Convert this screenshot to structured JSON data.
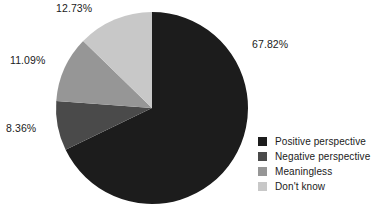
{
  "chart_data": {
    "type": "pie",
    "title": "",
    "labels": [
      "Positive perspective",
      "Negative perspective",
      "Meaningless",
      "Don't know"
    ],
    "values": [
      67.82,
      11.09,
      8.36,
      12.73
    ],
    "value_labels": [
      "67.82%",
      "11.09%",
      "8.36%",
      "12.73%"
    ],
    "units": "percent",
    "colors": [
      "#1c1c1c",
      "#4a4a4a",
      "#969696",
      "#c8c8c8"
    ],
    "legend_position": "right-bottom",
    "grid": false,
    "start_angle_deg": 0,
    "direction": "clockwise",
    "slice_order_clockwise": [
      "Positive perspective",
      "Negative perspective",
      "Meaningless",
      "Don't know"
    ],
    "slice_values_clockwise": [
      67.82,
      8.36,
      11.09,
      12.73
    ]
  },
  "labels": {
    "positive": "67.82%",
    "negative": "8.36%",
    "meaningless": "11.09%",
    "dontknow": "12.73%"
  },
  "legend": {
    "items": [
      {
        "label": "Positive perspective",
        "color": "#1c1c1c"
      },
      {
        "label": "Negative perspective",
        "color": "#4a4a4a"
      },
      {
        "label": "Meaningless",
        "color": "#969696"
      },
      {
        "label": "Don't know",
        "color": "#c8c8c8"
      }
    ]
  },
  "geometry": {
    "center_x": 152,
    "center_y": 108,
    "radius": 96
  }
}
